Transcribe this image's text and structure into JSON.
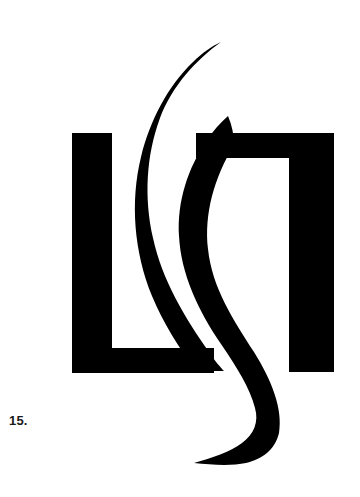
{
  "page": {
    "background_color": "#ffffff",
    "width": 360,
    "height": 497
  },
  "figure": {
    "caption": "15.",
    "caption_color": "#1a1a1a",
    "mark_color": "#000000",
    "alt_name": "abstract-logo-mark",
    "elements": {
      "left_bracket_name": "left-bracket-shape",
      "right_bracket_name": "right-bracket-shape",
      "outer_curve_name": "outer-s-curve-stroke",
      "inner_curve_name": "inner-s-curve-stroke"
    }
  }
}
